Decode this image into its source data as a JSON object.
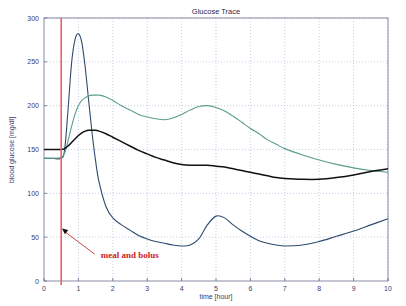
{
  "chart_data": {
    "type": "line",
    "title": "Glucose Trace",
    "xlabel": "time [hour]",
    "ylabel": "blood glucose [mg/dl]",
    "xlim": [
      0,
      10
    ],
    "ylim": [
      0,
      300
    ],
    "xticks": [
      0,
      1,
      2,
      3,
      4,
      5,
      6,
      7,
      8,
      9,
      10
    ],
    "yticks": [
      0,
      50,
      100,
      150,
      200,
      250,
      300
    ],
    "xtick_labels": [
      "0",
      "1",
      "2",
      "3",
      "4",
      "5",
      "6",
      "7",
      "8",
      "9",
      "10"
    ],
    "ytick_labels": [
      "0",
      "50",
      "100",
      "150",
      "200",
      "250",
      "300"
    ],
    "grid": true,
    "legend": "none",
    "x": [
      0,
      0.25,
      0.5,
      0.6,
      0.7,
      0.8,
      0.9,
      1.0,
      1.1,
      1.2,
      1.3,
      1.4,
      1.5,
      1.6,
      1.8,
      2.0,
      2.25,
      2.5,
      2.75,
      3.0,
      3.25,
      3.5,
      3.75,
      4.0,
      4.25,
      4.5,
      4.75,
      5.0,
      5.25,
      5.5,
      5.75,
      6.0,
      6.25,
      6.5,
      6.75,
      7.0,
      7.5,
      8.0,
      8.5,
      9.0,
      9.5,
      10.0
    ],
    "series": [
      {
        "name": "no-control glucose trace",
        "color": "#2e4a6e",
        "values": [
          140,
          140,
          140,
          150,
          196,
          248,
          275,
          282,
          272,
          243,
          205,
          168,
          137,
          113,
          85,
          72,
          64,
          58,
          52,
          48,
          45,
          43,
          41,
          40,
          41,
          48,
          64,
          74,
          72,
          64,
          57,
          51,
          46,
          43,
          41,
          40,
          41,
          45,
          51,
          57,
          64,
          71
        ]
      },
      {
        "name": "open-loop glucose trace",
        "color": "#5a9e86",
        "values": [
          140,
          140,
          141,
          146,
          160,
          176,
          190,
          200,
          206,
          209,
          211,
          212,
          212,
          212,
          210,
          206,
          200,
          195,
          190,
          187,
          185,
          184,
          186,
          190,
          195,
          199,
          200,
          198,
          194,
          188,
          181,
          174,
          168,
          161,
          156,
          151,
          144,
          138,
          133,
          129,
          126,
          124
        ]
      },
      {
        "name": "closed-loop glucose trace",
        "color": "#111111",
        "values": [
          150,
          150,
          150,
          151,
          154,
          158,
          162,
          166,
          169,
          171,
          172,
          172,
          172,
          171,
          168,
          164,
          159,
          154,
          149,
          145,
          141,
          138,
          135,
          133,
          132,
          132,
          132,
          131,
          130,
          128,
          126,
          124,
          122,
          120,
          118,
          117,
          116,
          116,
          118,
          121,
          125,
          128
        ]
      }
    ],
    "event_line": {
      "x": 0.5,
      "color": "#f06060",
      "label": "meal and bolus",
      "label_color": "#d02020",
      "arrow_tip_x": 0.52,
      "arrow_tip_y": 60,
      "label_x": 1.65,
      "label_y": 26
    }
  },
  "icons": {
    "arrow": "annotation-arrow"
  }
}
